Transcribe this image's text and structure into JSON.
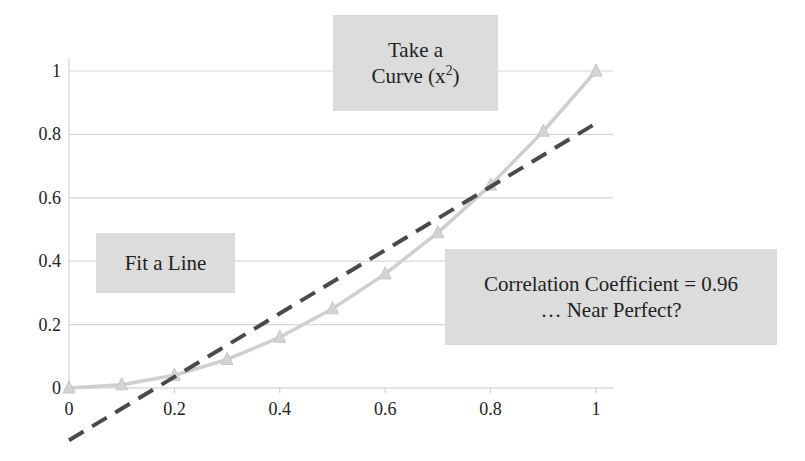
{
  "chart_data": {
    "type": "line",
    "title": "",
    "xlabel": "",
    "ylabel": "",
    "xlim": [
      0,
      1
    ],
    "ylim": [
      0,
      1
    ],
    "x_ticks": [
      "0",
      "0.2",
      "0.4",
      "0.6",
      "0.8",
      "1"
    ],
    "y_ticks": [
      "0",
      "0.2",
      "0.4",
      "0.6",
      "0.8",
      "1"
    ],
    "grid": {
      "horizontal": true,
      "vertical": false
    },
    "legend": null,
    "series": [
      {
        "name": "y = x^2",
        "style": "solid light-gray line with triangle markers",
        "color": "#cfcfcf",
        "x": [
          0,
          0.1,
          0.2,
          0.3,
          0.4,
          0.5,
          0.6,
          0.7,
          0.8,
          0.9,
          1.0
        ],
        "y": [
          0,
          0.01,
          0.04,
          0.09,
          0.16,
          0.25,
          0.36,
          0.49,
          0.64,
          0.81,
          1.0
        ]
      },
      {
        "name": "Linear fit",
        "style": "dashed dark-gray line",
        "color": "#4a4a4a",
        "x": [
          0,
          1
        ],
        "y": [
          -0.165,
          0.835
        ]
      }
    ],
    "annotations": [
      {
        "id": "curve",
        "line1": "Take a",
        "line2_prefix": "Curve (x",
        "line2_sup": "2",
        "line2_suffix": ")"
      },
      {
        "id": "line",
        "text": "Fit a Line"
      },
      {
        "id": "corr",
        "line1": "Correlation Coefficient = 0.96",
        "line2": "… Near Perfect?"
      }
    ]
  },
  "callouts": {
    "curve": {
      "line1": "Take a",
      "line2_prefix": "Curve (x",
      "sup": "2",
      "line2_suffix": ")"
    },
    "line": {
      "text": "Fit a Line"
    },
    "corr": {
      "line1": "Correlation Coefficient = 0.96",
      "line2": "… Near Perfect?"
    }
  },
  "axis": {
    "x_ticks": [
      "0",
      "0.2",
      "0.4",
      "0.6",
      "0.8",
      "1"
    ],
    "y_ticks": [
      "0",
      "0.2",
      "0.4",
      "0.6",
      "0.8",
      "1"
    ]
  },
  "colors": {
    "curve": "#cfcfcf",
    "fit_line": "#4a4a4a",
    "gridline": "#d6d6d6",
    "callout_bg": "#dcdcdc"
  }
}
